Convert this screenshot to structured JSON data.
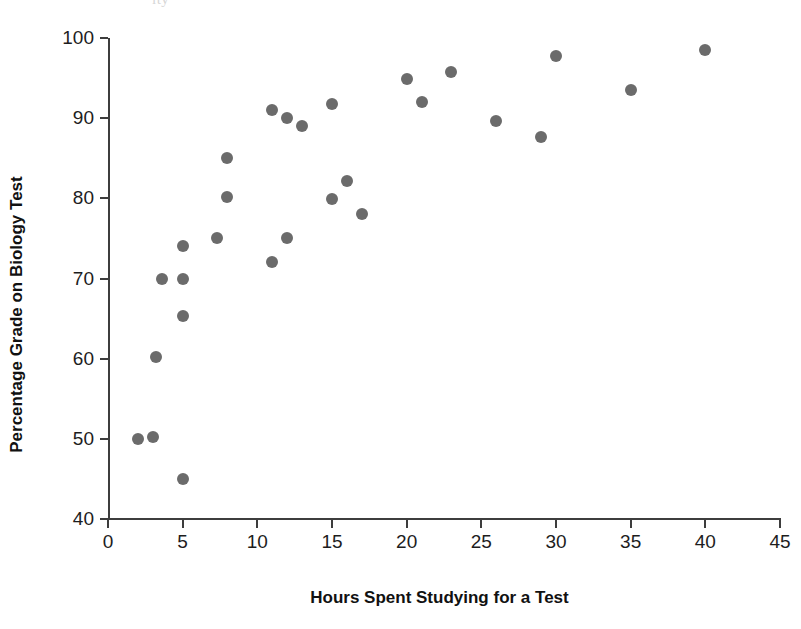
{
  "artifact_text": "ity",
  "chart_data": {
    "type": "scatter",
    "title": "",
    "xlabel": "Hours Spent Studying for a Test",
    "ylabel": "Percentage Grade on Biology Test",
    "xlim": [
      0,
      45
    ],
    "ylim": [
      40,
      100
    ],
    "xticks": [
      0,
      5,
      10,
      15,
      20,
      25,
      30,
      35,
      40,
      45
    ],
    "yticks": [
      40,
      50,
      60,
      70,
      80,
      90,
      100
    ],
    "grid": false,
    "legend": null,
    "marker_color": "#6b6b6b",
    "points": [
      {
        "x": 2,
        "y": 50.0
      },
      {
        "x": 3,
        "y": 50.2
      },
      {
        "x": 3.2,
        "y": 60.2
      },
      {
        "x": 3.6,
        "y": 70.0
      },
      {
        "x": 5,
        "y": 70.0
      },
      {
        "x": 5,
        "y": 74.0
      },
      {
        "x": 5,
        "y": 65.3
      },
      {
        "x": 5,
        "y": 45.0
      },
      {
        "x": 7.3,
        "y": 75.0
      },
      {
        "x": 8,
        "y": 85.0
      },
      {
        "x": 8,
        "y": 80.2
      },
      {
        "x": 11,
        "y": 91.0
      },
      {
        "x": 11,
        "y": 72.0
      },
      {
        "x": 12,
        "y": 90.0
      },
      {
        "x": 12,
        "y": 75.0
      },
      {
        "x": 13,
        "y": 89.0
      },
      {
        "x": 15,
        "y": 91.8
      },
      {
        "x": 15,
        "y": 79.9
      },
      {
        "x": 16,
        "y": 82.1
      },
      {
        "x": 17,
        "y": 78.0
      },
      {
        "x": 20,
        "y": 94.9
      },
      {
        "x": 21,
        "y": 92.0
      },
      {
        "x": 23,
        "y": 95.8
      },
      {
        "x": 26,
        "y": 89.7
      },
      {
        "x": 29,
        "y": 87.6
      },
      {
        "x": 30,
        "y": 97.8
      },
      {
        "x": 35,
        "y": 93.5
      },
      {
        "x": 40,
        "y": 98.5
      }
    ]
  }
}
